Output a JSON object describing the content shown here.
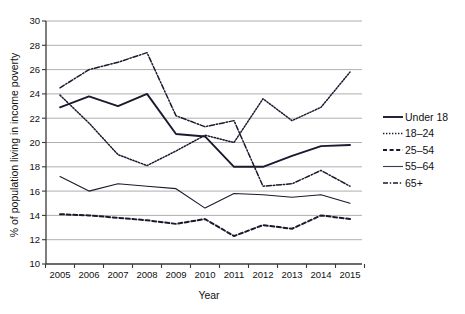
{
  "chart_data": {
    "type": "line",
    "title": "",
    "xlabel": "Year",
    "ylabel": "% of population living in income poverty",
    "x": [
      2005,
      2006,
      2007,
      2008,
      2009,
      2010,
      2011,
      2012,
      2013,
      2014,
      2015
    ],
    "xtick_labels": [
      "2005",
      "2006",
      "2007",
      "2008",
      "2009",
      "2010",
      "2011",
      "2012",
      "2013",
      "2014",
      "2015"
    ],
    "ytick_labels": [
      "10",
      "12",
      "14",
      "16",
      "18",
      "20",
      "22",
      "24",
      "26",
      "28",
      "30"
    ],
    "ylim": [
      10,
      30
    ],
    "ytick_step": 2,
    "grid": "horizontal",
    "legend_position": "right",
    "series": [
      {
        "name": "Under 18",
        "style": "solid-thick",
        "color": "#1a1a2e",
        "values": [
          22.9,
          23.8,
          23.0,
          24.0,
          20.7,
          20.5,
          18.0,
          18.0,
          18.9,
          19.7,
          19.8
        ]
      },
      {
        "name": "18–24",
        "style": "dotted",
        "color": "#1a1a2e",
        "values": [
          23.9,
          21.6,
          19.0,
          18.1,
          19.3,
          20.6,
          20.0,
          23.6,
          21.8,
          22.9,
          25.8
        ]
      },
      {
        "name": "25–54",
        "style": "dashed",
        "color": "#1a1a2e",
        "values": [
          14.1,
          14.0,
          13.8,
          13.6,
          13.3,
          13.7,
          12.3,
          13.2,
          12.9,
          14.0,
          13.7
        ]
      },
      {
        "name": "55–64",
        "style": "solid-thin",
        "color": "#3a3a55",
        "values": [
          17.2,
          16.0,
          16.6,
          16.4,
          16.2,
          14.6,
          15.8,
          15.7,
          15.5,
          15.7,
          15.0
        ]
      },
      {
        "name": "65+",
        "style": "dash-dot",
        "color": "#1a1a2e",
        "values": [
          24.5,
          26.0,
          26.6,
          27.4,
          22.2,
          21.3,
          21.8,
          16.4,
          16.6,
          17.7,
          16.4
        ]
      }
    ]
  },
  "legend": {
    "items": [
      {
        "label": "Under 18"
      },
      {
        "label": "18–24"
      },
      {
        "label": "25–54"
      },
      {
        "label": "55–64"
      },
      {
        "label": "65+"
      }
    ]
  },
  "axes": {
    "x_title": "Year",
    "y_title": "% of population living in income poverty"
  }
}
